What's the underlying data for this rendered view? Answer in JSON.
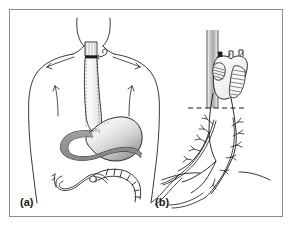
{
  "figure": {
    "domain": "medical-illustration",
    "panels": [
      {
        "id": "a",
        "label": "(a)",
        "caption": "Anterior torso view: gastric conduit routed to cervical esophagogastric anastomosis",
        "structures": [
          {
            "name": "head-and-neck-outline",
            "kind": "body-contour"
          },
          {
            "name": "shoulder-outline-left",
            "kind": "body-contour"
          },
          {
            "name": "shoulder-outline-right",
            "kind": "body-contour"
          },
          {
            "name": "torso-outline",
            "kind": "body-contour"
          },
          {
            "name": "cervical-anastomosis",
            "kind": "suture-line"
          },
          {
            "name": "anastomosis-arrow",
            "kind": "pointer"
          },
          {
            "name": "cervical-esophagus-stump",
            "kind": "viscus"
          },
          {
            "name": "gastric-conduit",
            "kind": "viscus"
          },
          {
            "name": "stomach-body",
            "kind": "viscus",
            "shading": "gradient"
          },
          {
            "name": "duodenum",
            "kind": "viscus",
            "shading": "solid-gray"
          },
          {
            "name": "jejunum",
            "kind": "viscus"
          },
          {
            "name": "transverse-colon",
            "kind": "viscus"
          },
          {
            "name": "staple-line",
            "kind": "suture-line"
          }
        ]
      },
      {
        "id": "b",
        "label": "(b)",
        "caption": "Detail of gastric tube with vascular pedicle crossing the diaphragm",
        "structures": [
          {
            "name": "mediastinal-channel",
            "kind": "anatomic-tunnel",
            "shading": "gradient"
          },
          {
            "name": "gastric-tube",
            "kind": "viscus"
          },
          {
            "name": "folded-fundus",
            "kind": "viscus"
          },
          {
            "name": "staple-line-anterior",
            "kind": "suture-line"
          },
          {
            "name": "staple-line-posterior",
            "kind": "suture-line"
          },
          {
            "name": "diaphragm-level-line",
            "kind": "dashed-reference-line"
          },
          {
            "name": "diaphragm-contour",
            "kind": "body-contour"
          },
          {
            "name": "gastroepiploic-arcade",
            "kind": "vessel"
          },
          {
            "name": "vascular-branches",
            "kind": "vessel"
          },
          {
            "name": "pedicle-vessels",
            "kind": "vessel"
          }
        ]
      }
    ]
  },
  "colors": {
    "frame_border": "#8d8d8d",
    "page_background": "#ffffff",
    "ink": "#1a1a1a",
    "line": "#222222",
    "stomach_light": "#f2f2f2",
    "stomach_mid": "#c9c9c9",
    "stomach_dark": "#8f8f8f",
    "duodenum_fill": "#8a8a8a",
    "channel_light": "#efefef",
    "channel_dark": "#9a9a9a",
    "label_color": "#1a1a1a"
  }
}
